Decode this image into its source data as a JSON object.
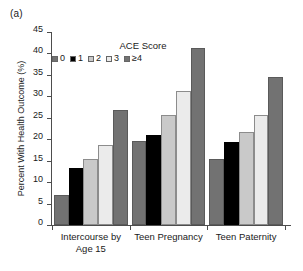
{
  "panel": {
    "label": "(a)"
  },
  "legend": {
    "title": "ACE Score",
    "position": "inside-top-left",
    "items": [
      {
        "label": "0",
        "color": "#727272",
        "swatch_name": "legend-swatch-ace-0"
      },
      {
        "label": "1",
        "color": "#000000",
        "swatch_name": "legend-swatch-ace-1"
      },
      {
        "label": "2",
        "color": "#c9c9c9",
        "swatch_name": "legend-swatch-ace-2"
      },
      {
        "label": "3",
        "color": "#ebebeb",
        "swatch_name": "legend-swatch-ace-3"
      },
      {
        "label": "≥4",
        "color": "#727272",
        "swatch_name": "legend-swatch-ace-4plus"
      }
    ]
  },
  "chart_data": {
    "type": "bar",
    "title": "",
    "xlabel": "",
    "ylabel": "Percent With Health Outcome (%)",
    "ylim": [
      0,
      45
    ],
    "ytick_step": 5,
    "yticks": [
      0,
      5,
      10,
      15,
      20,
      25,
      30,
      35,
      40,
      45
    ],
    "ytick_labels": [
      "0",
      "5",
      "10",
      "15",
      "20",
      "25",
      "30",
      "35",
      "40",
      "45"
    ],
    "grid": false,
    "legend_title": "ACE Score",
    "legend_position": "inside-top-left",
    "categories": [
      "Intercourse by Age 15",
      "Teen Pregnancy",
      "Teen Paternity"
    ],
    "category_lines": [
      [
        "Intercourse by",
        "Age 15"
      ],
      [
        "Teen Pregnancy",
        ""
      ],
      [
        "Teen Paternity",
        ""
      ]
    ],
    "series": [
      {
        "name": "0",
        "color": "#727272",
        "values": [
          7.0,
          19.6,
          15.5
        ]
      },
      {
        "name": "1",
        "color": "#000000",
        "values": [
          13.4,
          21.1,
          19.3
        ]
      },
      {
        "name": "2",
        "color": "#c9c9c9",
        "values": [
          15.4,
          25.6,
          21.8
        ]
      },
      {
        "name": "3",
        "color": "#ebebeb",
        "values": [
          18.7,
          31.2,
          25.6
        ]
      },
      {
        "name": "≥4",
        "color": "#727272",
        "values": [
          26.8,
          41.2,
          34.4
        ]
      }
    ]
  }
}
